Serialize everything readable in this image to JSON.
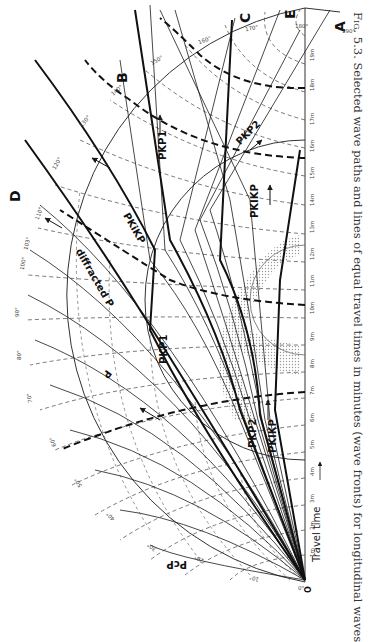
{
  "caption": {
    "figure_number": "Fig. 5.3.",
    "text": "Selected wave paths and lines of equal travel times in minutes (wave fronts) for longitudinal waves"
  },
  "points": {
    "O": "O",
    "A": "A",
    "B": "B",
    "C": "C",
    "D": "D",
    "E": "E"
  },
  "phase_labels": {
    "P": "P",
    "diffracted_P": "diffracted P",
    "PcP": "PcP",
    "PKP1_upper": "PKP1",
    "PKP1_lower": "PKP1",
    "PKP2_upper": "PKP2",
    "PKP2_lower": "PKP2",
    "PKiKP": "PKiKP",
    "PKIKP_upper": "PKIKP",
    "PKIKP_lower": "PKIKP"
  },
  "axis": {
    "label": "Travel time",
    "arrow": "→",
    "minute_ticks": [
      "0",
      "1m",
      "2m",
      "3m",
      "4m",
      "5m",
      "6m",
      "7m",
      "8m",
      "9m",
      "10m",
      "11m",
      "12m",
      "13m",
      "14m",
      "15m",
      "16m",
      "17m",
      "18m",
      "19m",
      "20m"
    ]
  },
  "degree_ticks": [
    "0°",
    "10°",
    "20°",
    "30°",
    "40°",
    "50°",
    "60°",
    "70°",
    "80°",
    "90°",
    "100°",
    "103°",
    "110°",
    "120°",
    "130°",
    "140°",
    "150°",
    "160°",
    "170°",
    "180°",
    "190°"
  ],
  "colors": {
    "ink": "#1a1a1a",
    "grid": "#555555",
    "shade": "#bdbdbd",
    "caption": "#333333"
  }
}
